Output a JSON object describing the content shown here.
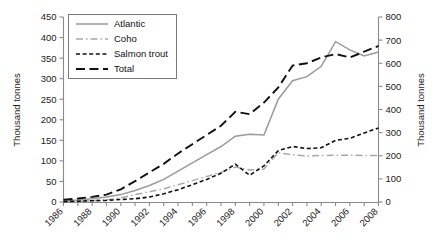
{
  "chart_data": {
    "type": "line",
    "title": "",
    "xlabel": "",
    "ylabel": "Thousand tonnes",
    "ylabel_right": "Thousand tonnes",
    "x": [
      1986,
      1987,
      1988,
      1989,
      1990,
      1991,
      1992,
      1993,
      1994,
      1995,
      1996,
      1997,
      1998,
      1999,
      2000,
      2001,
      2002,
      2003,
      2004,
      2005,
      2006,
      2007,
      2008
    ],
    "xlim": [
      1986,
      2008
    ],
    "ylim": [
      0,
      450
    ],
    "ylim_right": [
      0,
      800
    ],
    "yticks": [
      0,
      50,
      100,
      150,
      200,
      250,
      300,
      350,
      400,
      450
    ],
    "yticks_right": [
      0,
      100,
      200,
      300,
      400,
      500,
      600,
      700,
      800
    ],
    "xticks_labeled": [
      "1986",
      "1988",
      "1990",
      "1992",
      "1994",
      "1996",
      "1998",
      "2000",
      "2002",
      "2004",
      "2006",
      "2008"
    ],
    "grid": false,
    "legend_position": "upper-left",
    "series": [
      {
        "name": "Atlantic",
        "axis": "left",
        "style": "solid",
        "color": "#9a9a9a",
        "values": [
          3,
          5,
          8,
          12,
          18,
          28,
          40,
          55,
          75,
          95,
          115,
          135,
          160,
          165,
          163,
          250,
          295,
          305,
          330,
          390,
          370,
          355,
          365
        ]
      },
      {
        "name": "Coho",
        "axis": "left",
        "style": "dash-dot",
        "color": "#a8a8a8",
        "values": [
          1,
          2,
          3,
          5,
          10,
          18,
          25,
          32,
          42,
          52,
          62,
          72,
          85,
          78,
          80,
          120,
          115,
          112,
          113,
          114,
          114,
          113,
          113
        ]
      },
      {
        "name": "Salmon trout",
        "axis": "left",
        "style": "dashed",
        "color": "#111111",
        "values": [
          1,
          2,
          3,
          4,
          6,
          8,
          12,
          20,
          30,
          42,
          55,
          70,
          92,
          65,
          88,
          125,
          135,
          130,
          132,
          150,
          155,
          168,
          180
        ]
      },
      {
        "name": "Total",
        "axis": "right",
        "style": "long-dash",
        "color": "#111111",
        "values": [
          10,
          15,
          22,
          32,
          55,
          90,
          128,
          165,
          210,
          250,
          290,
          330,
          390,
          380,
          430,
          495,
          590,
          600,
          625,
          640,
          625,
          650,
          675
        ]
      }
    ]
  },
  "legend": {
    "entries": [
      {
        "label": "Atlantic"
      },
      {
        "label": "Coho"
      },
      {
        "label": "Salmon trout"
      },
      {
        "label": "Total"
      }
    ]
  },
  "axes": {
    "left_title": "Thousand tonnes",
    "right_title": "Thousand tonnes"
  }
}
